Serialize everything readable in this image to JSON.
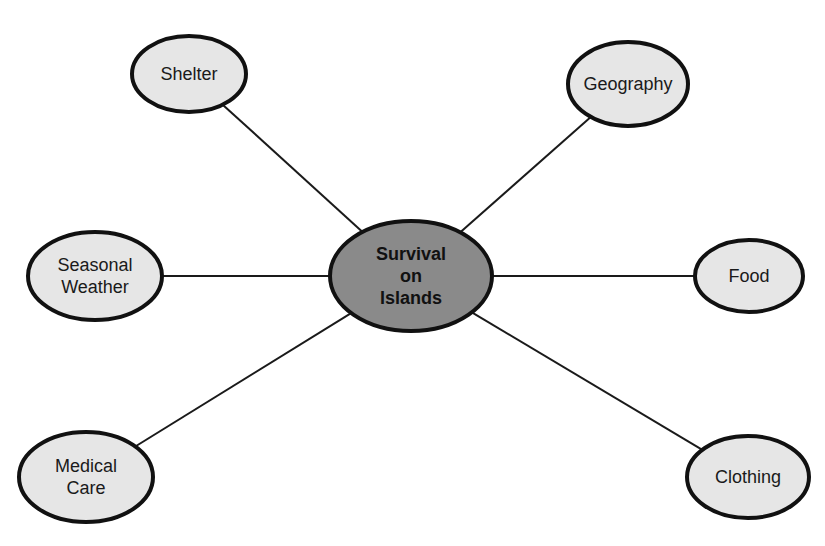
{
  "diagram": {
    "type": "concept-map",
    "center": {
      "lines": [
        "Survival",
        "on",
        "Islands"
      ],
      "cx": 411,
      "cy": 276,
      "rx": 81,
      "ry": 55,
      "fill": "#8a8a8a"
    },
    "nodes": [
      {
        "id": "shelter",
        "lines": [
          "Shelter"
        ],
        "cx": 189,
        "cy": 74,
        "rx": 57,
        "ry": 38
      },
      {
        "id": "geography",
        "lines": [
          "Geography"
        ],
        "cx": 628,
        "cy": 84,
        "rx": 60,
        "ry": 42
      },
      {
        "id": "seasonal-weather",
        "lines": [
          "Seasonal",
          "Weather"
        ],
        "cx": 95,
        "cy": 276,
        "rx": 67,
        "ry": 44
      },
      {
        "id": "food",
        "lines": [
          "Food"
        ],
        "cx": 749,
        "cy": 276,
        "rx": 54,
        "ry": 36
      },
      {
        "id": "medical-care",
        "lines": [
          "Medical",
          "Care"
        ],
        "cx": 86,
        "cy": 477,
        "rx": 67,
        "ry": 45
      },
      {
        "id": "clothing",
        "lines": [
          "Clothing"
        ],
        "cx": 748,
        "cy": 477,
        "rx": 61,
        "ry": 41
      }
    ],
    "node_fill": "#e6e6e6",
    "stroke": "#111111"
  }
}
